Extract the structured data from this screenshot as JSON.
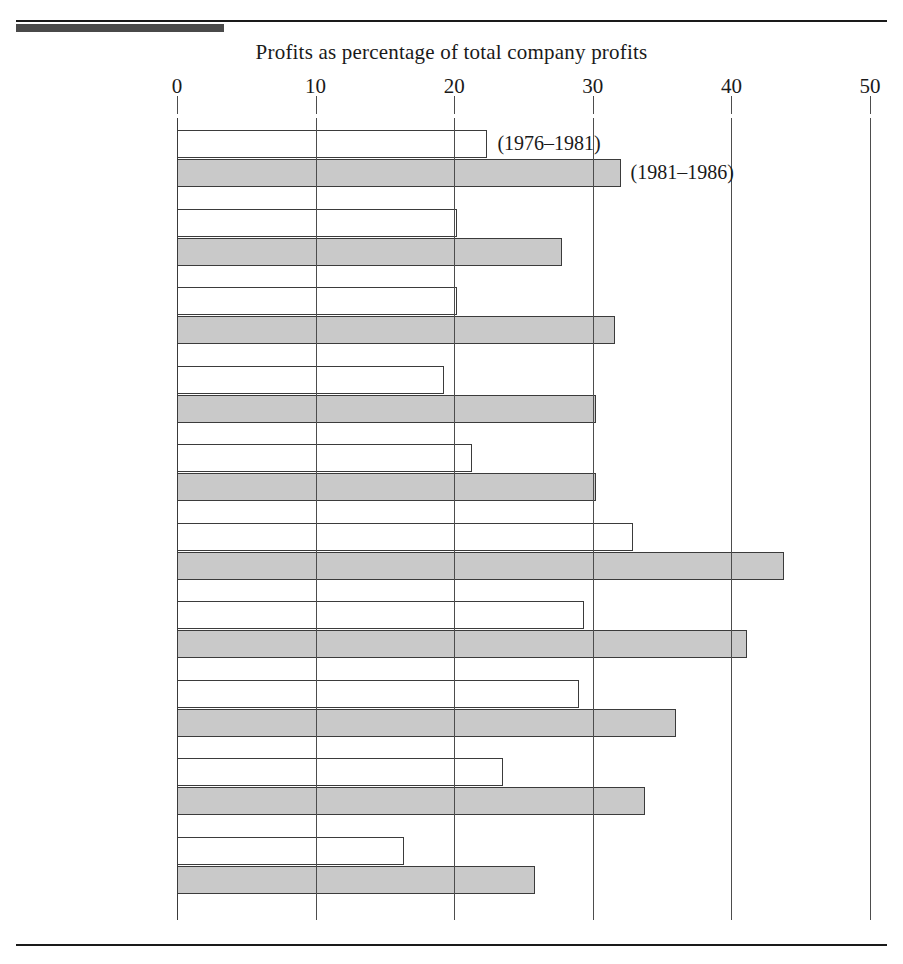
{
  "figure": {
    "title": "Profits as percentage of total company profits",
    "annotations": [
      {
        "text": "(1976–1981)",
        "series": "light"
      },
      {
        "text": "(1981–1986)",
        "series": "dark"
      }
    ]
  },
  "chart_data": {
    "type": "bar",
    "orientation": "horizontal",
    "title": "Profits as percentage of total company profits",
    "xlabel": "Profits as percentage of total company profits",
    "ylabel": "",
    "xlim": [
      0,
      50
    ],
    "xticks": [
      0,
      10,
      20,
      30,
      40,
      50
    ],
    "xtick_labels": [
      "0",
      "10",
      "20",
      "30",
      "40",
      "50"
    ],
    "grid": false,
    "legend_position": "inline-annotation",
    "categories": [
      "All-industry\ntotal",
      "Chemicals",
      "Industrial\nmachinery",
      "OEM\ncomponents",
      "Power-\ngenerating\nequipment",
      "Information\nprocessing",
      "Instruments\nand controls",
      "Consumer\ndurables",
      "Textiles",
      "Consumer\nnondurables"
    ],
    "series": [
      {
        "name": "(1976–1981)",
        "fill": "#ffffff",
        "values": [
          22.4,
          20.2,
          20.2,
          19.3,
          21.3,
          32.9,
          29.4,
          29.0,
          23.5,
          16.4
        ]
      },
      {
        "name": "(1981–1986)",
        "fill": "#c9c9c9",
        "values": [
          32.0,
          27.8,
          31.6,
          30.2,
          30.2,
          43.8,
          41.1,
          36.0,
          33.8,
          25.8
        ]
      }
    ]
  }
}
